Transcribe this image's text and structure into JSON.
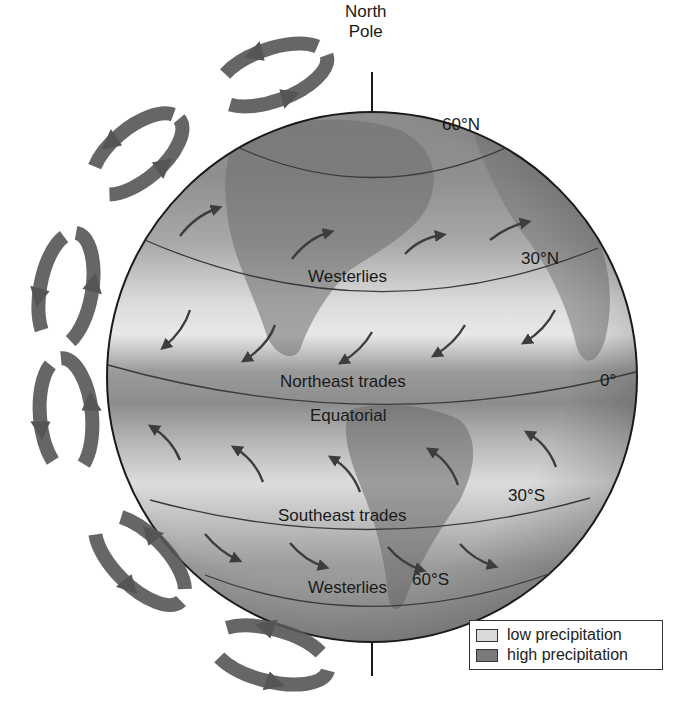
{
  "pole_labels": {
    "north": "North\nPole",
    "north_line1": "North",
    "north_line2": "Pole"
  },
  "latitude_labels": {
    "lat_60n": "60°N",
    "lat_30n": "30°N",
    "lat_0": "0°",
    "lat_30s": "30°S",
    "lat_60s": "60°S"
  },
  "wind_belts": {
    "westerlies_north": "Westerlies",
    "northeast_trades": "Northeast trades",
    "equatorial": "Equatorial",
    "southeast_trades": "Southeast trades",
    "westerlies_south": "Westerlies"
  },
  "legend": {
    "items": [
      {
        "label": "low precipitation",
        "color": "#d9d9d9"
      },
      {
        "label": "high precipitation",
        "color": "#7a7a7a"
      }
    ]
  },
  "colors": {
    "globe_dark": "#8a8a8a",
    "globe_light": "#e6e6e6",
    "arrow": "#4a4a4a",
    "outline": "#1a1a1a"
  },
  "circulation_cells": [
    {
      "id": "polar-north",
      "count": 2
    },
    {
      "id": "ferrel-north",
      "count": 1
    },
    {
      "id": "hadley-north",
      "count": 1
    },
    {
      "id": "hadley-south",
      "count": 1
    },
    {
      "id": "ferrel-south",
      "count": 1
    },
    {
      "id": "polar-south",
      "count": 1
    }
  ]
}
